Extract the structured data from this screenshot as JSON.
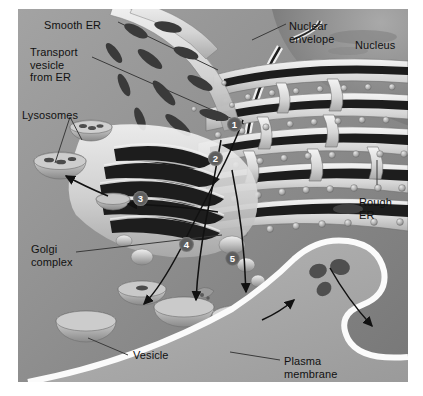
{
  "figure": {
    "style": "grayscale biological illustration"
  },
  "labels": [
    {
      "id": "smooth-er",
      "text": "Smooth ER",
      "x": 44,
      "y": 19,
      "align": "left"
    },
    {
      "id": "transport-vesicle",
      "text": "Transport\nvesicle\nfrom ER",
      "x": 30,
      "y": 46,
      "align": "left"
    },
    {
      "id": "lysosomes",
      "text": "Lysosomes",
      "x": 22,
      "y": 109,
      "align": "left"
    },
    {
      "id": "golgi-complex",
      "text": "Golgi\ncomplex",
      "x": 31,
      "y": 243,
      "align": "left"
    },
    {
      "id": "vesicle",
      "text": "Vesicle",
      "x": 133,
      "y": 349,
      "align": "left"
    },
    {
      "id": "nuclear-envelope",
      "text": "Nuclear envelope",
      "x": 289,
      "y": 20,
      "align": "left"
    },
    {
      "id": "nucleus",
      "text": "Nucleus",
      "x": 355,
      "y": 39,
      "align": "left"
    },
    {
      "id": "rough-er",
      "text": "Rough\nER",
      "x": 359,
      "y": 196,
      "align": "left"
    },
    {
      "id": "plasma-membrane",
      "text": "Plasma\nmembrane",
      "x": 284,
      "y": 355,
      "align": "left"
    }
  ],
  "steps": [
    {
      "number": "1",
      "x": 227,
      "y": 117
    },
    {
      "number": "2",
      "x": 208,
      "y": 151
    },
    {
      "number": "3",
      "x": 133,
      "y": 191
    },
    {
      "number": "4",
      "x": 179,
      "y": 237
    },
    {
      "number": "5",
      "x": 225,
      "y": 251
    }
  ],
  "colors": {
    "cytoplasm": "#8f8f8f",
    "membrane_light": "#efefef",
    "lumen_dark": "#1d1d1d",
    "badge_fill": "#5d5d5d",
    "badge_text": "#ffffff",
    "label_text": "#111111",
    "leader_line": "#3a3a3a",
    "page_background": "#ffffff"
  },
  "structures": [
    {
      "name": "nucleus",
      "description": "large granular region, upper right"
    },
    {
      "name": "nuclear-envelope",
      "description": "double membrane bounding the nucleus"
    },
    {
      "name": "rough-er",
      "description": "stacked cisternae studded with ribosomes, right"
    },
    {
      "name": "smooth-er",
      "description": "tubular network, upper center-left"
    },
    {
      "name": "golgi-complex",
      "description": "stack of flattened curved cisternae, center"
    },
    {
      "name": "lysosome",
      "description": "bowl-shaped vesicle with granular contents"
    },
    {
      "name": "transport-vesicle",
      "description": "small rounded vesicle budding from ER"
    },
    {
      "name": "secretory-vesicle",
      "description": "vesicle fusing with plasma membrane"
    },
    {
      "name": "plasma-membrane",
      "description": "bright white band at lower right boundary"
    },
    {
      "name": "secreted-product",
      "description": "dark granules released outside the cell"
    }
  ]
}
